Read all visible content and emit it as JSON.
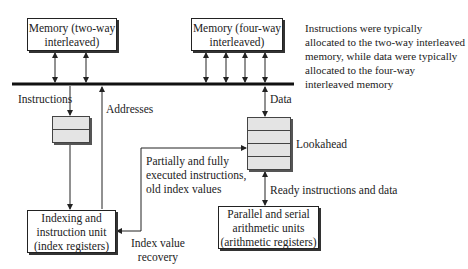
{
  "boxes": {
    "memory_two_way": [
      "Memory (two-way",
      "interleaved)"
    ],
    "memory_four_way": [
      "Memory (four-way",
      "interleaved)"
    ],
    "indexing_unit": [
      "Indexing and",
      "instruction unit",
      "(index registers)"
    ],
    "arithmetic_units": [
      "Parallel and serial",
      "arithmetic units",
      "(arithmetic registers)"
    ]
  },
  "labels": {
    "instructions": "Instructions",
    "addresses": "Addresses",
    "data": "Data",
    "lookahead": "Lookahead",
    "partially_executed": [
      "Partially and fully",
      "executed instructions,",
      "old index values"
    ],
    "ready": "Ready instructions and data",
    "index_recovery": [
      "Index value",
      "recovery"
    ]
  },
  "note": [
    "Instructions were typically",
    "allocated to the two-way interleaved",
    "memory, while data were typically",
    "allocated to the four-way",
    "interleaved memory"
  ],
  "buffers": {
    "instruction_buffer_rows": 2,
    "lookahead_rows": 4
  }
}
